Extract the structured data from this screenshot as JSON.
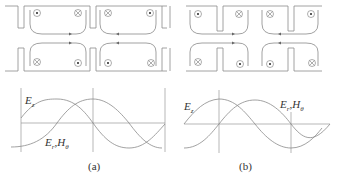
{
  "figure": {
    "panels": [
      {
        "id": "a",
        "caption": "(a)",
        "structure": "disk-loaded waveguide cavities, open (pi mode)",
        "top_row_marks": [
          "dot",
          "cross",
          "cross",
          "dot"
        ],
        "bottom_row_marks": [
          "cross",
          "dot",
          "dot",
          "cross"
        ],
        "wave_labels": {
          "ez": "E",
          "ez_sub": "z",
          "er_h": "E",
          "er_sub": "r",
          "comma": ",",
          "h": "H",
          "h_sub": "θ"
        }
      },
      {
        "id": "b",
        "caption": "(b)",
        "structure": "coupled cavities with nose cones",
        "top_row_marks": [
          "dot",
          "cross",
          "cross",
          "dot"
        ],
        "bottom_row_marks": [
          "cross",
          "dot",
          "dot",
          "cross"
        ],
        "wave_labels": {
          "ez": "E",
          "ez_sub": "z",
          "er_h": "E",
          "er_sub": "r",
          "comma": ",",
          "h": "H",
          "h_sub": "θ"
        }
      }
    ]
  }
}
